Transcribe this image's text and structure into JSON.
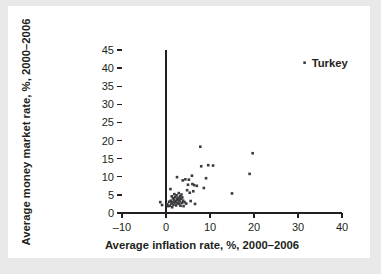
{
  "figure": {
    "background_color": "#e9e9e9",
    "panel_color": "#ffffff",
    "ink_color": "#231f20",
    "point_color": "#3b3b3f"
  },
  "chart_data": {
    "type": "scatter",
    "title": "",
    "xlabel": "Average inflation rate, %, 2000–2006",
    "ylabel": "Average money market rate, %, 2000–2006",
    "xlim": [
      -10,
      40
    ],
    "ylim": [
      0,
      45
    ],
    "xticks": [
      -10,
      0,
      10,
      20,
      30,
      40
    ],
    "xticklabels": [
      "–10",
      "0",
      "10",
      "20",
      "30",
      "40"
    ],
    "yticks": [
      0,
      5,
      10,
      15,
      20,
      25,
      30,
      35,
      40,
      45
    ],
    "yticklabels": [
      "0",
      "5",
      "10",
      "15",
      "20",
      "25",
      "30",
      "35",
      "40",
      "45"
    ],
    "grid": false,
    "legend": false,
    "annotations": [
      {
        "text": "Turkey",
        "x": 31.5,
        "y": 41.5,
        "dx": 1.6,
        "dy": 0.0
      }
    ],
    "points": [
      {
        "x": -1.3,
        "y": 3.0
      },
      {
        "x": -0.9,
        "y": 2.2
      },
      {
        "x": 0.3,
        "y": 2.4
      },
      {
        "x": 0.5,
        "y": 1.9
      },
      {
        "x": 0.7,
        "y": 3.1
      },
      {
        "x": 0.9,
        "y": 2.0
      },
      {
        "x": 1.0,
        "y": 6.6
      },
      {
        "x": 1.1,
        "y": 3.4
      },
      {
        "x": 1.2,
        "y": 2.6
      },
      {
        "x": 1.3,
        "y": 4.6
      },
      {
        "x": 1.4,
        "y": 1.6
      },
      {
        "x": 1.5,
        "y": 3.0
      },
      {
        "x": 1.6,
        "y": 4.1
      },
      {
        "x": 1.7,
        "y": 2.3
      },
      {
        "x": 1.8,
        "y": 3.7
      },
      {
        "x": 1.9,
        "y": 5.2
      },
      {
        "x": 2.0,
        "y": 2.9
      },
      {
        "x": 2.1,
        "y": 4.4
      },
      {
        "x": 2.2,
        "y": 3.3
      },
      {
        "x": 2.3,
        "y": 2.1
      },
      {
        "x": 2.4,
        "y": 4.9
      },
      {
        "x": 2.5,
        "y": 3.8
      },
      {
        "x": 2.5,
        "y": 9.9
      },
      {
        "x": 2.6,
        "y": 2.7
      },
      {
        "x": 2.7,
        "y": 4.2
      },
      {
        "x": 2.8,
        "y": 3.5
      },
      {
        "x": 2.9,
        "y": 5.5
      },
      {
        "x": 3.0,
        "y": 2.5
      },
      {
        "x": 3.0,
        "y": 4.0
      },
      {
        "x": 3.1,
        "y": 3.2
      },
      {
        "x": 3.2,
        "y": 4.6
      },
      {
        "x": 3.3,
        "y": 2.0
      },
      {
        "x": 3.4,
        "y": 3.9
      },
      {
        "x": 3.5,
        "y": 5.1
      },
      {
        "x": 3.6,
        "y": 2.8
      },
      {
        "x": 3.7,
        "y": 4.3
      },
      {
        "x": 3.8,
        "y": 9.0
      },
      {
        "x": 3.9,
        "y": 3.4
      },
      {
        "x": 4.0,
        "y": 1.9
      },
      {
        "x": 4.2,
        "y": 3.0
      },
      {
        "x": 4.4,
        "y": 9.3
      },
      {
        "x": 4.6,
        "y": 2.6
      },
      {
        "x": 4.8,
        "y": 6.3
      },
      {
        "x": 5.0,
        "y": 7.8
      },
      {
        "x": 5.2,
        "y": 9.2
      },
      {
        "x": 5.4,
        "y": 5.6
      },
      {
        "x": 5.6,
        "y": 3.3
      },
      {
        "x": 5.9,
        "y": 10.3
      },
      {
        "x": 6.0,
        "y": 8.0
      },
      {
        "x": 6.2,
        "y": 6.0
      },
      {
        "x": 6.4,
        "y": 7.7
      },
      {
        "x": 6.6,
        "y": 2.5
      },
      {
        "x": 7.0,
        "y": 7.5
      },
      {
        "x": 7.8,
        "y": 18.3
      },
      {
        "x": 8.0,
        "y": 12.9
      },
      {
        "x": 8.6,
        "y": 6.9
      },
      {
        "x": 9.1,
        "y": 9.6
      },
      {
        "x": 9.6,
        "y": 13.2
      },
      {
        "x": 10.7,
        "y": 13.1
      },
      {
        "x": 15.0,
        "y": 5.4
      },
      {
        "x": 19.0,
        "y": 10.8
      },
      {
        "x": 19.7,
        "y": 16.5
      },
      {
        "x": 31.5,
        "y": 41.5
      }
    ]
  }
}
